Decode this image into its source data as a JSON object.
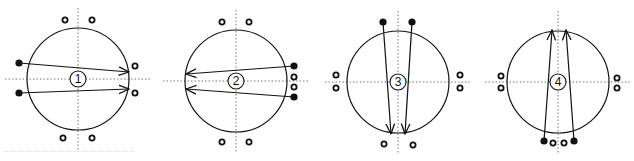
{
  "figure": {
    "panels": [
      {
        "label": "1",
        "center": [
          78,
          79
        ],
        "radius": 51,
        "filled_dots": [
          [
            19,
            63
          ],
          [
            19,
            93
          ]
        ],
        "open_dots": [
          [
            65,
            20
          ],
          [
            92,
            20
          ],
          [
            135,
            66
          ],
          [
            135,
            93
          ],
          [
            63,
            138
          ],
          [
            92,
            138
          ]
        ],
        "arrows": [
          [
            [
              19,
              63
            ],
            [
              129,
              72
            ]
          ],
          [
            [
              19,
              93
            ],
            [
              129,
              89
            ]
          ]
        ]
      },
      {
        "label": "2",
        "center": [
          236,
          81
        ],
        "radius": 51,
        "filled_dots": [
          [
            294,
            66
          ],
          [
            294,
            97
          ]
        ],
        "open_dots": [
          [
            294,
            77
          ],
          [
            294,
            87
          ],
          [
            222,
            22
          ],
          [
            249,
            22
          ],
          [
            222,
            142
          ],
          [
            249,
            142
          ]
        ],
        "arrows": [
          [
            [
              294,
              66
            ],
            [
              186,
              74
            ]
          ],
          [
            [
              294,
              97
            ],
            [
              186,
              89
            ]
          ]
        ]
      },
      {
        "label": "3",
        "center": [
          398,
          82
        ],
        "radius": 51,
        "filled_dots": [
          [
            383,
            22
          ],
          [
            412,
            22
          ]
        ],
        "open_dots": [
          [
            336,
            75
          ],
          [
            336,
            88
          ],
          [
            460,
            75
          ],
          [
            460,
            88
          ],
          [
            384,
            144
          ],
          [
            413,
            145
          ]
        ],
        "arrows": [
          [
            [
              383,
              22
            ],
            [
              391,
              134
            ]
          ],
          [
            [
              412,
              22
            ],
            [
              405,
              134
            ]
          ]
        ]
      },
      {
        "label": "4",
        "center": [
          558,
          82
        ],
        "radius": 51,
        "filled_dots": [
          [
            544,
            141
          ],
          [
            574,
            141
          ]
        ],
        "open_dots": [
          [
            553,
            143
          ],
          [
            564,
            143
          ],
          [
            501,
            76
          ],
          [
            501,
            88
          ],
          [
            617,
            78
          ],
          [
            617,
            88
          ]
        ],
        "arrows": [
          [
            [
              544,
              141
            ],
            [
              552,
              30
            ]
          ],
          [
            [
              574,
              141
            ],
            [
              566,
              30
            ]
          ]
        ]
      }
    ],
    "colors": {
      "stroke": "#111111",
      "axis": "#777777",
      "background": "#ffffff"
    }
  }
}
